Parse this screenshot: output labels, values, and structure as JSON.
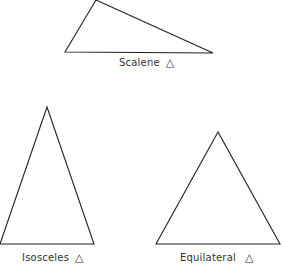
{
  "triangles": [
    {
      "name": "Scalene",
      "label": "Scalene",
      "symbol": "△",
      "points": "96,0 65,52 213,53"
    },
    {
      "name": "Isosceles",
      "label": "Isosceles",
      "symbol": "△",
      "points": "47,107 0,244 94,244"
    },
    {
      "name": "Equilateral",
      "label": "Equilateral",
      "symbol": "△",
      "points": "218,132 156,244 280,244"
    }
  ],
  "stroke_color": "#222222"
}
